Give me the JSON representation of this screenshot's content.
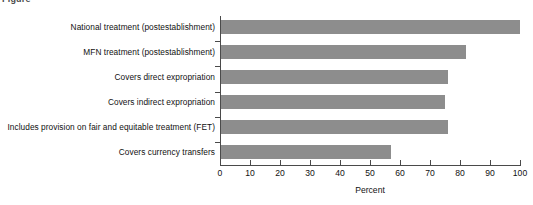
{
  "clipped_header_text": "Figure",
  "chart_data": {
    "type": "bar",
    "orientation": "horizontal",
    "title": "",
    "subtitle": "",
    "xlabel": "Percent",
    "ylabel": "",
    "xlim": [
      0,
      100
    ],
    "xticks": [
      0,
      10,
      20,
      30,
      40,
      50,
      60,
      70,
      80,
      90,
      100
    ],
    "xtick_labels": [
      "0",
      "10",
      "20",
      "30",
      "40",
      "50",
      "60",
      "70",
      "80",
      "90",
      "100"
    ],
    "grid": false,
    "legend": false,
    "bar_color": "#8d8d8d",
    "axis_color": "#4a4a4a",
    "categories": [
      "National treatment (postestablishment)",
      "MFN treatment (postestablishment)",
      "Covers direct expropriation",
      "Covers indirect expropriation",
      "Includes provision on fair and equitable treatment (FET)",
      "Covers currency transfers"
    ],
    "values": [
      100,
      82,
      76,
      75,
      76,
      57
    ]
  }
}
